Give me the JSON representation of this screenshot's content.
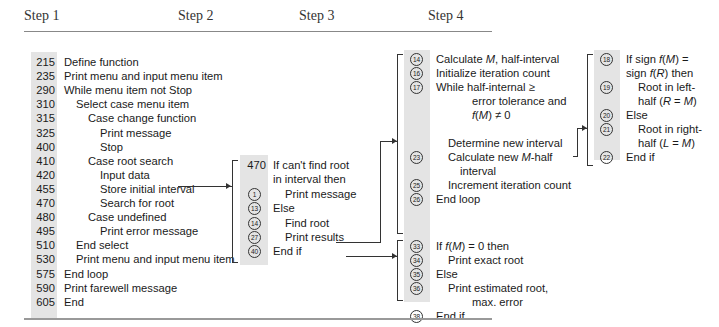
{
  "headers": [
    "Step 1",
    "Step 2",
    "Step 3",
    "Step 4"
  ],
  "step1": {
    "lines": [
      {
        "num": "215",
        "text": "Define function",
        "indent": 0
      },
      {
        "num": "235",
        "text": "Print menu and input menu item",
        "indent": 0
      },
      {
        "num": "290",
        "text": "While menu item not Stop",
        "indent": 0
      },
      {
        "num": "310",
        "text": "Select case menu item",
        "indent": 1
      },
      {
        "num": "315",
        "text": "Case change function",
        "indent": 2
      },
      {
        "num": "325",
        "text": "Print message",
        "indent": 3
      },
      {
        "num": "400",
        "text": "Stop",
        "indent": 3
      },
      {
        "num": "410",
        "text": "Case root search",
        "indent": 2
      },
      {
        "num": "420",
        "text": "Input data",
        "indent": 3
      },
      {
        "num": "455",
        "text": "Store initial interval",
        "indent": 3
      },
      {
        "num": "470",
        "text": "Search for root",
        "indent": 3
      },
      {
        "num": "480",
        "text": "Case undefined",
        "indent": 2
      },
      {
        "num": "495",
        "text": "Print error message",
        "indent": 3
      },
      {
        "num": "510",
        "text": "End select",
        "indent": 1
      },
      {
        "num": "530",
        "text": "Print menu and input menu item",
        "indent": 1
      },
      {
        "num": "575",
        "text": "End loop",
        "indent": 0
      },
      {
        "num": "590",
        "text": "Print farewell message",
        "indent": 0
      },
      {
        "num": "605",
        "text": "End",
        "indent": 0
      }
    ]
  },
  "step2": {
    "lines": [
      {
        "num": "470",
        "text": "If can't find root"
      },
      {
        "num": "",
        "text": "in interval then"
      },
      {
        "num": "1",
        "text": "Print message"
      },
      {
        "num": "13",
        "text": "Else"
      },
      {
        "num": "14",
        "text": "Find root"
      },
      {
        "num": "27",
        "text": "Print results"
      },
      {
        "num": "40",
        "text": "End if"
      }
    ]
  },
  "step3a": {
    "lines": [
      {
        "num": "14",
        "text": "Calculate M, half-interval"
      },
      {
        "num": "16",
        "text": "Initialize iteration count"
      },
      {
        "num": "17",
        "text": "While half-internal ≥"
      },
      {
        "num": "",
        "text": "error tolerance and"
      },
      {
        "num": "",
        "text": "f(M) ≠ 0"
      },
      {
        "num": "",
        "text": "Determine new interval"
      },
      {
        "num": "23",
        "text": "Calculate new M-half"
      },
      {
        "num": "",
        "text": "interval"
      },
      {
        "num": "25",
        "text": "Increment iteration count"
      },
      {
        "num": "26",
        "text": "End loop"
      }
    ]
  },
  "step3b": {
    "lines": [
      {
        "num": "33",
        "text": "If f(M) = 0 then"
      },
      {
        "num": "34",
        "text": "Print exact root"
      },
      {
        "num": "35",
        "text": "Else"
      },
      {
        "num": "36",
        "text": "Print estimated root,"
      },
      {
        "num": "",
        "text": "max. error"
      },
      {
        "num": "38",
        "text": "End if"
      }
    ]
  },
  "step4": {
    "lines": [
      {
        "num": "18",
        "text": "If sign f(M) ="
      },
      {
        "num": "",
        "text": "sign f(R) then"
      },
      {
        "num": "19",
        "text": "Root in left-"
      },
      {
        "num": "",
        "text": "half (R = M)"
      },
      {
        "num": "20",
        "text": "Else"
      },
      {
        "num": "21",
        "text": "Root in right-"
      },
      {
        "num": "",
        "text": "half (L = M)"
      },
      {
        "num": "22",
        "text": "End if"
      }
    ]
  }
}
